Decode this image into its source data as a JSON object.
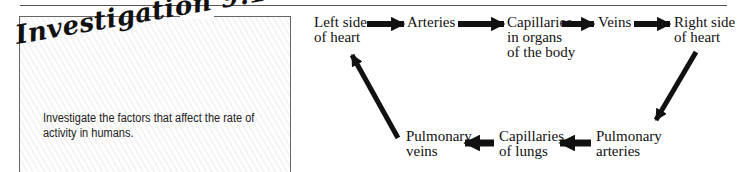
{
  "investigation": {
    "title": "Investigation 9.1",
    "description": "Investigate the factors that affect the rate of activity in humans."
  },
  "diagram": {
    "nodes": [
      {
        "id": "left-heart",
        "line1": "Left side",
        "line2": "of heart",
        "line3": ""
      },
      {
        "id": "arteries",
        "line1": "Arteries",
        "line2": "",
        "line3": ""
      },
      {
        "id": "capillaries-organs",
        "line1": "Capillaries",
        "line2": "in organs",
        "line3": "of the body"
      },
      {
        "id": "veins",
        "line1": "Veins",
        "line2": "",
        "line3": ""
      },
      {
        "id": "right-heart",
        "line1": "Right side",
        "line2": "of heart",
        "line3": ""
      },
      {
        "id": "pulmonary-arteries",
        "line1": "Pulmonary",
        "line2": "arteries",
        "line3": ""
      },
      {
        "id": "capillaries-lungs",
        "line1": "Capillaries",
        "line2": "of lungs",
        "line3": ""
      },
      {
        "id": "pulmonary-veins",
        "line1": "Pulmonary",
        "line2": "veins",
        "line3": ""
      }
    ],
    "flow": [
      [
        "left-heart",
        "arteries"
      ],
      [
        "arteries",
        "capillaries-organs"
      ],
      [
        "capillaries-organs",
        "veins"
      ],
      [
        "veins",
        "right-heart"
      ],
      [
        "right-heart",
        "pulmonary-arteries"
      ],
      [
        "pulmonary-arteries",
        "capillaries-lungs"
      ],
      [
        "capillaries-lungs",
        "pulmonary-veins"
      ],
      [
        "pulmonary-veins",
        "left-heart"
      ]
    ]
  }
}
